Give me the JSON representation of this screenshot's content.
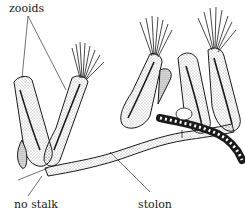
{
  "figure": {
    "stroke_color": "#1a1a1a",
    "background": "#ffffff"
  },
  "labels": {
    "zooids": "zooids",
    "no_stalk": "no stalk",
    "stolon": "stolon"
  }
}
